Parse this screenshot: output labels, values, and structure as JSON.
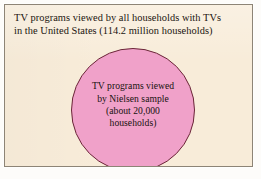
{
  "diagram": {
    "type": "nested-set-venn",
    "colors": {
      "panel_background": "#f8ecd9",
      "panel_border": "#8d8476",
      "circle_fill": "#f0a1c9",
      "circle_outline": "#6b2638",
      "text": "#17120e",
      "page_background": "#ffffff"
    },
    "population": {
      "name": "population-set",
      "shape": "rectangle",
      "label_lines": [
        "TV programs viewed by all households with TVs",
        "in the United States (114.2 million households)"
      ],
      "count_text": "114.2 million households",
      "count_value": 114200000
    },
    "sample": {
      "name": "sample-set",
      "shape": "circle",
      "label_lines": [
        "TV programs viewed",
        "by Nielsen sample",
        "(about 20,000",
        "households)"
      ],
      "count_text": "about 20,000 households",
      "count_value": 20000
    }
  }
}
